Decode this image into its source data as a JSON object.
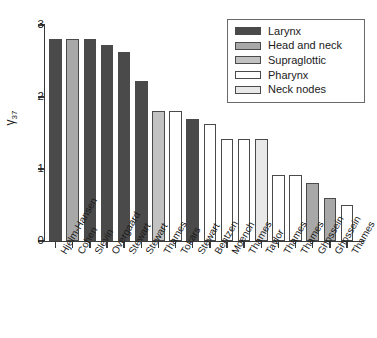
{
  "chart_data": {
    "type": "bar",
    "title": "",
    "xlabel": "",
    "ylabel": "γ37",
    "ylabel_base": "γ",
    "ylabel_sub": "37",
    "ylim": [
      0,
      3
    ],
    "yticks": [
      0,
      1,
      2,
      3
    ],
    "ytick_labels": [
      "0",
      "1",
      "2",
      "3"
    ],
    "grid": false,
    "legend_position": "top-right",
    "categories": [
      "Hjelm-Hansen",
      "Cohen",
      "Slevin",
      "Overgaard",
      "Stewart",
      "Stewart",
      "Thames",
      "Tokars",
      "Stewart",
      "Bentzen",
      "Moench",
      "Thames",
      "Taylor",
      "Thames",
      "Thames",
      "Ghossein",
      "Ghossein",
      "Thames"
    ],
    "values": [
      2.8,
      2.8,
      2.8,
      2.72,
      2.62,
      2.22,
      1.81,
      1.81,
      1.7,
      1.62,
      1.42,
      1.42,
      1.42,
      0.91,
      0.92,
      0.8,
      0.6,
      0.5
    ],
    "groups": [
      "Larynx",
      "Head and neck",
      "Larynx",
      "Larynx",
      "Larynx",
      "Larynx",
      "Supraglottic",
      "Pharynx",
      "Larynx",
      "Pharynx",
      "Pharynx",
      "Pharynx",
      "Neck nodes",
      "Pharynx",
      "Pharynx",
      "Head and neck",
      "Head and neck",
      "Pharynx"
    ],
    "series": [
      {
        "name": "Larynx",
        "color": "#4a4a4a"
      },
      {
        "name": "Head and neck",
        "color": "#a8a8a8"
      },
      {
        "name": "Supraglottic",
        "color": "#c2c2c2"
      },
      {
        "name": "Pharynx",
        "color": "#ffffff"
      },
      {
        "name": "Neck nodes",
        "color": "#e8e8e8"
      }
    ]
  },
  "legend": {
    "items": [
      {
        "label": "Larynx",
        "color": "#4a4a4a"
      },
      {
        "label": "Head and neck",
        "color": "#a8a8a8"
      },
      {
        "label": "Supraglottic",
        "color": "#c2c2c2"
      },
      {
        "label": "Pharynx",
        "color": "#ffffff"
      },
      {
        "label": "Neck nodes",
        "color": "#e8e8e8"
      }
    ]
  },
  "colors": {
    "axis": "#3a3a3a",
    "bar_stroke": "#4a4a4a",
    "text": "#1a1a1a",
    "background": "#ffffff"
  }
}
